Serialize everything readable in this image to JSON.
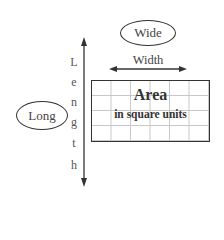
{
  "diagram": {
    "wide_bubble": "Wide",
    "long_bubble": "Long",
    "width_label": "Width",
    "length_letters": [
      "L",
      "e",
      "n",
      "g",
      "t",
      "h"
    ],
    "area": {
      "title": "Area",
      "subtitle": "in square units",
      "grid_columns": 6,
      "grid_rows": 4
    },
    "colors": {
      "stroke": "#333333",
      "grid_lines": "#c8c8c8",
      "background": "#ffffff"
    }
  }
}
